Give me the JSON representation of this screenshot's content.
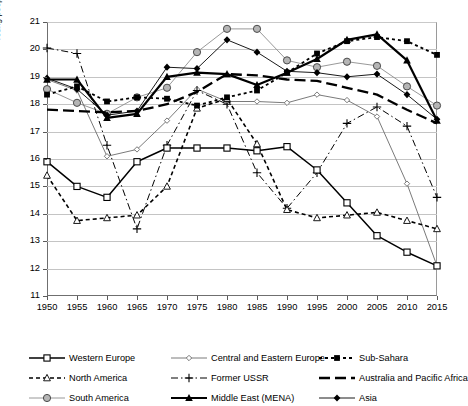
{
  "chart_data": {
    "type": "line",
    "title": "",
    "xlabel": "",
    "ylabel": "Young people aged 15–24 years as proportion of total population (in %)",
    "x": [
      1950,
      1955,
      1960,
      1965,
      1970,
      1975,
      1980,
      1985,
      1990,
      1995,
      2000,
      2005,
      2010,
      2015
    ],
    "xlim": [
      1950,
      2015
    ],
    "ylim": [
      11,
      21
    ],
    "yticks": [
      11,
      12,
      13,
      14,
      15,
      16,
      17,
      18,
      19,
      20,
      21
    ],
    "xticks": [
      "1950",
      "1955",
      "1960",
      "1965",
      "1970",
      "1975",
      "1980",
      "1985",
      "1990",
      "1995",
      "2000",
      "2005",
      "2010",
      "2015"
    ],
    "grid": "horizontal",
    "legend_position": "bottom",
    "series": [
      {
        "name": "Western Europe",
        "marker": "open-square",
        "line": "solid",
        "color": "#000000",
        "values": [
          15.9,
          15.0,
          14.6,
          15.9,
          16.4,
          16.4,
          16.4,
          16.3,
          16.45,
          15.6,
          14.4,
          13.2,
          12.6,
          12.1
        ]
      },
      {
        "name": "Central and Eastern Europe",
        "marker": "open-diamond-small",
        "line": "solid-thin",
        "color": "#6b6b6b",
        "values": [
          18.9,
          18.5,
          16.1,
          16.35,
          17.4,
          18.55,
          18.1,
          18.1,
          18.05,
          18.35,
          18.15,
          17.55,
          15.1,
          12.1
        ]
      },
      {
        "name": "Sub-Sahara",
        "marker": "filled-square",
        "line": "dotted",
        "color": "#000000",
        "values": [
          18.35,
          18.65,
          18.1,
          18.25,
          18.2,
          17.95,
          18.25,
          18.5,
          19.15,
          19.85,
          20.3,
          20.45,
          20.3,
          19.8
        ]
      },
      {
        "name": "North America",
        "marker": "open-triangle",
        "line": "dashed",
        "color": "#000000",
        "values": [
          15.4,
          13.75,
          13.85,
          13.95,
          15.0,
          17.85,
          18.2,
          16.55,
          14.15,
          13.85,
          13.95,
          14.05,
          13.75,
          13.45
        ]
      },
      {
        "name": "Former USSR",
        "marker": "plus",
        "line": "dash-dot",
        "color": "#000000",
        "values": [
          20.05,
          19.85,
          16.5,
          13.45,
          16.5,
          18.5,
          18.0,
          15.5,
          14.2,
          15.5,
          17.3,
          17.9,
          17.2,
          14.6
        ]
      },
      {
        "name": "Australia and Pacific Africa",
        "marker": "none",
        "line": "long-dash",
        "color": "#000000",
        "values": [
          17.8,
          17.75,
          17.7,
          17.75,
          18.0,
          18.45,
          19.1,
          19.05,
          18.9,
          18.85,
          18.6,
          18.35,
          17.8,
          17.3
        ]
      },
      {
        "name": "South America",
        "marker": "open-circle-grey",
        "line": "solid-thin",
        "color": "#8d8d8d",
        "values": [
          18.55,
          18.05,
          17.65,
          18.25,
          18.6,
          19.9,
          20.75,
          20.75,
          19.6,
          19.35,
          19.55,
          19.4,
          18.65,
          17.95
        ]
      },
      {
        "name": "Middle East (MENA)",
        "marker": "filled-triangle",
        "line": "solid-bold",
        "color": "#000000",
        "values": [
          18.9,
          18.9,
          17.5,
          17.65,
          19.0,
          19.15,
          19.1,
          18.7,
          19.15,
          19.65,
          20.35,
          20.55,
          19.6,
          17.4
        ]
      },
      {
        "name": "Asia",
        "marker": "filled-diamond",
        "line": "solid-thin",
        "color": "#000000",
        "values": [
          18.95,
          18.55,
          17.6,
          17.75,
          19.35,
          19.3,
          20.35,
          19.9,
          19.2,
          19.15,
          19.0,
          19.1,
          18.35,
          17.45
        ]
      }
    ]
  },
  "legend": {
    "items": [
      {
        "label": "Western Europe"
      },
      {
        "label": "Central and Eastern Europe"
      },
      {
        "label": "Sub-Sahara"
      },
      {
        "label": "North America"
      },
      {
        "label": "Former USSR"
      },
      {
        "label": "Australia and Pacific Africa"
      },
      {
        "label": "South America"
      },
      {
        "label": "Middle East (MENA)"
      },
      {
        "label": "Asia"
      }
    ]
  }
}
